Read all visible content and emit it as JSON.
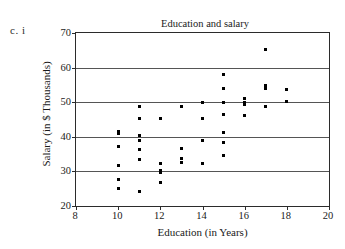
{
  "problem_label": "c.  i",
  "chart_data": {
    "type": "scatter",
    "title": "Education and salary",
    "xlabel": "Education (in Years)",
    "ylabel": "Salary (in $ Thousands)",
    "xlim": [
      8,
      20
    ],
    "ylim": [
      20,
      70
    ],
    "xticks": [
      8,
      10,
      12,
      14,
      16,
      18,
      20
    ],
    "yticks": [
      20,
      30,
      40,
      50,
      60,
      70
    ],
    "grid": "horizontal",
    "gridlines_y": [
      30,
      40,
      50,
      60
    ],
    "legend": null,
    "marker": "square",
    "marker_color": "#000000",
    "points": [
      {
        "x": 10,
        "y": 41.4
      },
      {
        "x": 10,
        "y": 40.9
      },
      {
        "x": 10,
        "y": 37.3
      },
      {
        "x": 10,
        "y": 31.6
      },
      {
        "x": 10,
        "y": 27.8
      },
      {
        "x": 10,
        "y": 25.0
      },
      {
        "x": 11,
        "y": 48.9
      },
      {
        "x": 11,
        "y": 45.4
      },
      {
        "x": 11,
        "y": 40.4
      },
      {
        "x": 11,
        "y": 39.0
      },
      {
        "x": 11,
        "y": 36.3
      },
      {
        "x": 11,
        "y": 33.3
      },
      {
        "x": 11,
        "y": 24.1
      },
      {
        "x": 12,
        "y": 45.4
      },
      {
        "x": 12,
        "y": 32.2
      },
      {
        "x": 12,
        "y": 30.2
      },
      {
        "x": 12,
        "y": 29.8
      },
      {
        "x": 12,
        "y": 26.8
      },
      {
        "x": 13,
        "y": 48.7
      },
      {
        "x": 13,
        "y": 36.5
      },
      {
        "x": 13,
        "y": 33.6
      },
      {
        "x": 13,
        "y": 32.7
      },
      {
        "x": 14,
        "y": 49.9
      },
      {
        "x": 14,
        "y": 45.4
      },
      {
        "x": 14,
        "y": 38.9
      },
      {
        "x": 14,
        "y": 32.3
      },
      {
        "x": 15,
        "y": 58.0
      },
      {
        "x": 15,
        "y": 54.1
      },
      {
        "x": 15,
        "y": 49.9
      },
      {
        "x": 15,
        "y": 46.4
      },
      {
        "x": 15,
        "y": 41.3
      },
      {
        "x": 15,
        "y": 38.3
      },
      {
        "x": 15,
        "y": 34.7
      },
      {
        "x": 16,
        "y": 51.0
      },
      {
        "x": 16,
        "y": 49.8
      },
      {
        "x": 16,
        "y": 49.3
      },
      {
        "x": 16,
        "y": 46.2
      },
      {
        "x": 17,
        "y": 65.1
      },
      {
        "x": 17,
        "y": 54.7
      },
      {
        "x": 17,
        "y": 54.1
      },
      {
        "x": 17,
        "y": 48.8
      },
      {
        "x": 18,
        "y": 53.8
      },
      {
        "x": 18,
        "y": 50.3
      }
    ]
  }
}
